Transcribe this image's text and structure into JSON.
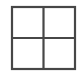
{
  "icon": {
    "name": "grid-view-icon",
    "rows": 2,
    "columns": 2,
    "stroke_color": "#474747",
    "background_color": "#ffffff"
  }
}
